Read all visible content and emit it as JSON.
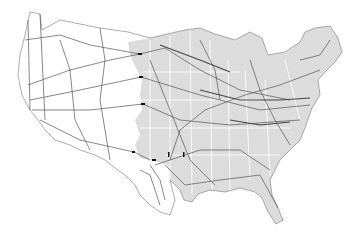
{
  "map": {
    "title": "United States natural gas pipeline network",
    "colors": {
      "background": "#ffffff",
      "east_region_fill": "#dcdcdc",
      "west_region_fill": "#ffffff",
      "state_border": "#ffffff",
      "pipeline": "#555555",
      "pipeline_light": "#7a7a7a",
      "outline": "#888888",
      "marker": "#111111"
    },
    "markers": [
      {
        "x": 140,
        "y": 54
      },
      {
        "x": 141,
        "y": 77
      },
      {
        "x": 143,
        "y": 104
      },
      {
        "x": 134,
        "y": 152
      },
      {
        "x": 154,
        "y": 160
      },
      {
        "x": 169,
        "y": 155
      },
      {
        "x": 171,
        "y": 157
      }
    ],
    "caption": ""
  }
}
